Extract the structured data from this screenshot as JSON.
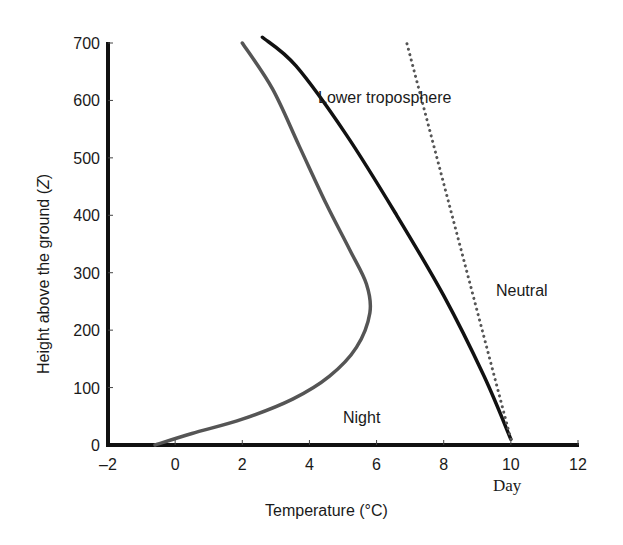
{
  "chart_data": {
    "type": "line",
    "title": "",
    "xlabel": "Temperature (°C)",
    "ylabel": "Height above the ground (Z)",
    "xlim": [
      -2,
      12
    ],
    "ylim": [
      0,
      700
    ],
    "xticks": [
      -2,
      0,
      2,
      4,
      6,
      8,
      10,
      12
    ],
    "yticks": [
      0,
      100,
      200,
      300,
      400,
      500,
      600,
      700
    ],
    "xtick_labels": [
      "–2",
      "0",
      "2",
      "4",
      "6",
      "8",
      "10",
      "12"
    ],
    "ytick_labels": [
      "0",
      "100",
      "200",
      "300",
      "400",
      "500",
      "600",
      "700"
    ],
    "grid": false,
    "legend": null,
    "series": [
      {
        "name": "Night",
        "style": "solid",
        "color": "#555555",
        "points": [
          [
            -0.6,
            0
          ],
          [
            0.5,
            20
          ],
          [
            2,
            45
          ],
          [
            3.5,
            80
          ],
          [
            4.6,
            120
          ],
          [
            5.4,
            170
          ],
          [
            5.8,
            230
          ],
          [
            5.7,
            280
          ],
          [
            5.2,
            340
          ],
          [
            4.5,
            420
          ],
          [
            3.7,
            520
          ],
          [
            2.9,
            620
          ],
          [
            2.0,
            700
          ]
        ]
      },
      {
        "name": "Day",
        "style": "solid",
        "color": "#111111",
        "points": [
          [
            10.0,
            10
          ],
          [
            9.2,
            120
          ],
          [
            8.0,
            260
          ],
          [
            6.6,
            400
          ],
          [
            5.1,
            540
          ],
          [
            3.6,
            660
          ],
          [
            2.6,
            710
          ]
        ]
      },
      {
        "name": "Neutral",
        "style": "dotted",
        "color": "#555555",
        "points": [
          [
            10.0,
            10
          ],
          [
            6.9,
            700
          ]
        ]
      }
    ],
    "annotations": [
      {
        "text": "Lower troposphere",
        "x": 6.1,
        "y": 650
      },
      {
        "text": "Neutral",
        "x": 9.5,
        "y": 270
      },
      {
        "text": "Night",
        "x": 4.9,
        "y": 50
      },
      {
        "text": "Day",
        "x": 10.0,
        "y": -80
      }
    ]
  },
  "labels": {
    "x_axis_title": "Temperature (°C)",
    "y_axis_title": "Height above the ground (Z)",
    "y_axis_title_main": "Height above the ground (",
    "y_axis_title_var": "Z",
    "y_axis_title_close": ")",
    "lower_troposphere": "Lower troposphere",
    "neutral": "Neutral",
    "night": "Night",
    "day": "Day"
  }
}
